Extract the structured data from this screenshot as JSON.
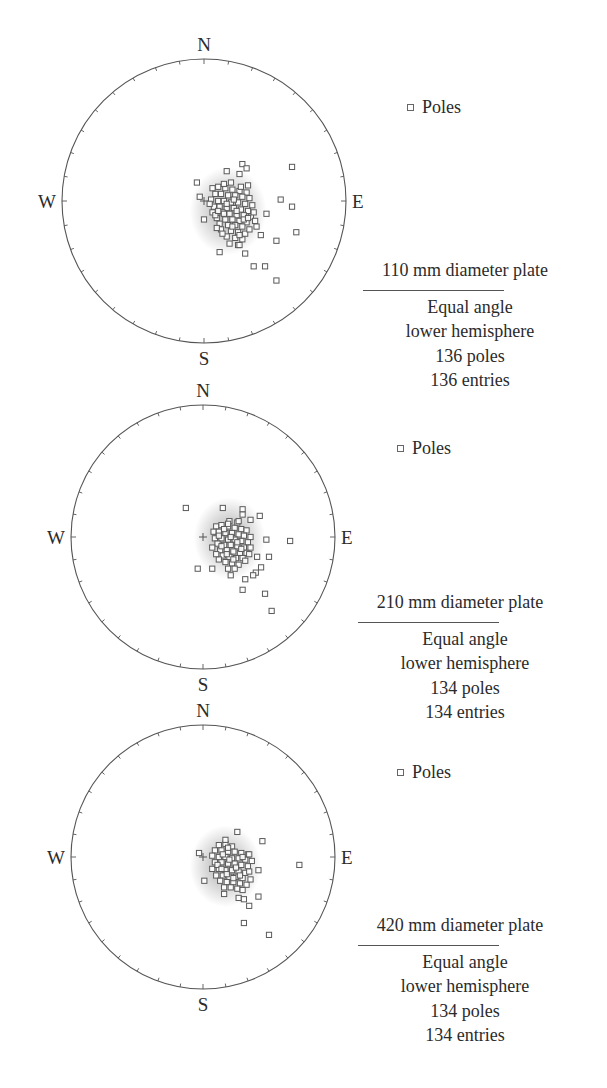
{
  "figure": {
    "legend_label": "Poles",
    "legend_marker": "square-marker-icon",
    "compass": {
      "north": "N",
      "south": "S",
      "east": "E",
      "west": "W"
    },
    "colors": {
      "circle": "#555555",
      "marker_stroke": "#5a5a5a",
      "density_halo": "#9a9a9a",
      "text": "#2b2b2b"
    }
  },
  "panels": [
    {
      "title": "110 mm diameter plate",
      "projection": "Equal angle",
      "hemisphere": "lower hemisphere",
      "poles_text": "136 poles",
      "entries_text": "136 entries"
    },
    {
      "title": "210 mm diameter plate",
      "projection": "Equal angle",
      "hemisphere": "lower hemisphere",
      "poles_text": "134 poles",
      "entries_text": "134 entries"
    },
    {
      "title": "420 mm diameter plate",
      "projection": "Equal angle",
      "hemisphere": "lower hemisphere",
      "poles_text": "134 poles",
      "entries_text": "134 entries"
    }
  ],
  "chart_data": [
    {
      "type": "scatter",
      "subtype": "stereonet",
      "title": "110 mm diameter plate",
      "projection": "Equal angle, lower hemisphere",
      "n_poles": 136,
      "n_entries": 136,
      "legend": [
        "Poles"
      ],
      "note": "points are approximate offsets from net center, in units of net radius (x east +, y south +)",
      "density_center": [
        0.17,
        0.07
      ],
      "points_outer": [
        [
          0.27,
          -0.26
        ],
        [
          0.3,
          -0.23
        ],
        [
          0.16,
          -0.21
        ],
        [
          0.25,
          -0.19
        ],
        [
          0.62,
          -0.24
        ],
        [
          -0.05,
          -0.13
        ],
        [
          -0.03,
          -0.03
        ],
        [
          0.0,
          0.13
        ],
        [
          0.54,
          -0.01
        ],
        [
          0.62,
          0.04
        ],
        [
          0.65,
          0.22
        ],
        [
          0.44,
          0.09
        ],
        [
          0.51,
          0.28
        ],
        [
          0.11,
          0.36
        ],
        [
          0.29,
          0.37
        ],
        [
          0.35,
          0.46
        ],
        [
          0.43,
          0.46
        ],
        [
          0.51,
          0.56
        ],
        [
          0.31,
          0.12
        ],
        [
          0.37,
          0.18
        ],
        [
          0.4,
          0.24
        ],
        [
          0.25,
          0.31
        ]
      ],
      "points_core": [
        [
          0.06,
          -0.09
        ],
        [
          0.1,
          -0.1
        ],
        [
          0.15,
          -0.09
        ],
        [
          0.2,
          -0.08
        ],
        [
          0.25,
          -0.07
        ],
        [
          0.3,
          -0.06
        ],
        [
          0.08,
          -0.05
        ],
        [
          0.12,
          -0.05
        ],
        [
          0.17,
          -0.04
        ],
        [
          0.22,
          -0.04
        ],
        [
          0.27,
          -0.03
        ],
        [
          0.32,
          -0.02
        ],
        [
          0.05,
          -0.01
        ],
        [
          0.1,
          0.0
        ],
        [
          0.14,
          0.0
        ],
        [
          0.19,
          0.01
        ],
        [
          0.24,
          0.01
        ],
        [
          0.29,
          0.02
        ],
        [
          0.34,
          0.03
        ],
        [
          0.07,
          0.04
        ],
        [
          0.11,
          0.04
        ],
        [
          0.16,
          0.05
        ],
        [
          0.21,
          0.05
        ],
        [
          0.26,
          0.06
        ],
        [
          0.31,
          0.07
        ],
        [
          0.06,
          0.08
        ],
        [
          0.13,
          0.08
        ],
        [
          0.18,
          0.09
        ],
        [
          0.23,
          0.1
        ],
        [
          0.28,
          0.1
        ],
        [
          0.33,
          0.11
        ],
        [
          0.09,
          0.12
        ],
        [
          0.15,
          0.13
        ],
        [
          0.2,
          0.13
        ],
        [
          0.25,
          0.14
        ],
        [
          0.3,
          0.15
        ],
        [
          0.11,
          0.16
        ],
        [
          0.17,
          0.17
        ],
        [
          0.22,
          0.17
        ],
        [
          0.27,
          0.18
        ],
        [
          0.12,
          0.2
        ],
        [
          0.19,
          0.21
        ],
        [
          0.24,
          0.22
        ],
        [
          0.29,
          0.23
        ],
        [
          0.16,
          0.25
        ],
        [
          0.22,
          0.26
        ],
        [
          0.27,
          0.27
        ],
        [
          0.18,
          0.3
        ],
        [
          0.24,
          0.31
        ],
        [
          0.13,
          0.23
        ],
        [
          0.09,
          0.19
        ],
        [
          0.35,
          0.08
        ],
        [
          0.36,
          0.14
        ],
        [
          0.04,
          0.02
        ],
        [
          0.21,
          -0.01
        ],
        [
          0.26,
          -0.1
        ],
        [
          0.14,
          -0.12
        ],
        [
          0.19,
          -0.13
        ],
        [
          0.31,
          -0.11
        ],
        [
          0.08,
          0.1
        ],
        [
          0.16,
          0.02
        ],
        [
          0.23,
          0.07
        ],
        [
          0.28,
          0.13
        ],
        [
          0.2,
          0.18
        ],
        [
          0.14,
          0.09
        ],
        [
          0.25,
          0.24
        ],
        [
          0.1,
          0.07
        ],
        [
          0.32,
          0.2
        ]
      ]
    },
    {
      "type": "scatter",
      "subtype": "stereonet",
      "title": "210 mm diameter plate",
      "projection": "Equal angle, lower hemisphere",
      "n_poles": 134,
      "n_entries": 134,
      "legend": [
        "Poles"
      ],
      "note": "points are approximate offsets from net center, in units of net radius (x east +, y south +)",
      "density_center": [
        0.2,
        0.01
      ],
      "points_outer": [
        [
          -0.13,
          -0.22
        ],
        [
          0.15,
          -0.22
        ],
        [
          0.3,
          -0.21
        ],
        [
          0.3,
          -0.17
        ],
        [
          0.43,
          -0.16
        ],
        [
          0.36,
          -0.13
        ],
        [
          0.66,
          0.03
        ],
        [
          0.48,
          0.02
        ],
        [
          0.5,
          0.15
        ],
        [
          0.41,
          0.15
        ],
        [
          -0.04,
          0.24
        ],
        [
          0.07,
          0.24
        ],
        [
          0.44,
          0.23
        ],
        [
          0.4,
          0.27
        ],
        [
          0.21,
          0.29
        ],
        [
          0.32,
          0.32
        ],
        [
          0.3,
          0.4
        ],
        [
          0.47,
          0.43
        ],
        [
          0.52,
          0.56
        ],
        [
          0.38,
          0.29
        ],
        [
          0.27,
          -0.12
        ],
        [
          0.19,
          -0.1
        ]
      ],
      "points_core": [
        [
          0.1,
          -0.08
        ],
        [
          0.14,
          -0.09
        ],
        [
          0.19,
          -0.08
        ],
        [
          0.24,
          -0.07
        ],
        [
          0.29,
          -0.06
        ],
        [
          0.33,
          -0.05
        ],
        [
          0.08,
          -0.04
        ],
        [
          0.12,
          -0.04
        ],
        [
          0.17,
          -0.03
        ],
        [
          0.22,
          -0.03
        ],
        [
          0.27,
          -0.02
        ],
        [
          0.31,
          -0.01
        ],
        [
          0.36,
          0.0
        ],
        [
          0.09,
          0.01
        ],
        [
          0.14,
          0.01
        ],
        [
          0.19,
          0.02
        ],
        [
          0.24,
          0.02
        ],
        [
          0.29,
          0.03
        ],
        [
          0.34,
          0.04
        ],
        [
          0.11,
          0.05
        ],
        [
          0.16,
          0.06
        ],
        [
          0.21,
          0.06
        ],
        [
          0.26,
          0.07
        ],
        [
          0.31,
          0.08
        ],
        [
          0.13,
          0.1
        ],
        [
          0.18,
          0.1
        ],
        [
          0.23,
          0.11
        ],
        [
          0.28,
          0.12
        ],
        [
          0.33,
          0.12
        ],
        [
          0.15,
          0.14
        ],
        [
          0.2,
          0.15
        ],
        [
          0.25,
          0.16
        ],
        [
          0.3,
          0.16
        ],
        [
          0.17,
          0.19
        ],
        [
          0.22,
          0.2
        ],
        [
          0.27,
          0.21
        ],
        [
          0.12,
          0.17
        ],
        [
          0.36,
          0.08
        ],
        [
          0.07,
          0.08
        ],
        [
          0.2,
          -0.12
        ],
        [
          0.26,
          -0.11
        ],
        [
          0.16,
          -0.06
        ],
        [
          0.21,
          0.0
        ],
        [
          0.26,
          0.04
        ],
        [
          0.18,
          0.13
        ],
        [
          0.23,
          0.17
        ],
        [
          0.29,
          0.09
        ],
        [
          0.14,
          0.07
        ],
        [
          0.32,
          0.18
        ],
        [
          0.24,
          0.24
        ],
        [
          0.19,
          0.24
        ],
        [
          0.1,
          0.13
        ],
        [
          0.35,
          0.13
        ],
        [
          0.12,
          -0.01
        ]
      ]
    },
    {
      "type": "scatter",
      "subtype": "stereonet",
      "title": "420 mm diameter plate",
      "projection": "Equal angle, lower hemisphere",
      "n_poles": 134,
      "n_entries": 134,
      "legend": [
        "Poles"
      ],
      "note": "points are approximate offsets from net center, in units of net radius (x east +, y south +)",
      "density_center": [
        0.17,
        0.07
      ],
      "points_outer": [
        [
          0.26,
          -0.19
        ],
        [
          0.45,
          -0.12
        ],
        [
          0.17,
          -0.13
        ],
        [
          -0.03,
          -0.03
        ],
        [
          0.73,
          0.06
        ],
        [
          0.35,
          -0.02
        ],
        [
          0.01,
          0.18
        ],
        [
          0.16,
          0.28
        ],
        [
          0.3,
          0.25
        ],
        [
          0.42,
          0.3
        ],
        [
          0.27,
          0.31
        ],
        [
          0.31,
          0.32
        ],
        [
          0.35,
          0.37
        ],
        [
          0.31,
          0.5
        ],
        [
          0.5,
          0.59
        ],
        [
          0.14,
          0.09
        ],
        [
          0.42,
          0.1
        ]
      ],
      "points_core": [
        [
          0.12,
          -0.09
        ],
        [
          0.17,
          -0.1
        ],
        [
          0.22,
          -0.08
        ],
        [
          0.09,
          -0.05
        ],
        [
          0.14,
          -0.05
        ],
        [
          0.19,
          -0.04
        ],
        [
          0.24,
          -0.04
        ],
        [
          0.29,
          -0.03
        ],
        [
          0.34,
          -0.02
        ],
        [
          0.07,
          -0.01
        ],
        [
          0.12,
          0.0
        ],
        [
          0.17,
          0.0
        ],
        [
          0.22,
          0.01
        ],
        [
          0.27,
          0.01
        ],
        [
          0.32,
          0.02
        ],
        [
          0.37,
          0.03
        ],
        [
          0.09,
          0.04
        ],
        [
          0.14,
          0.04
        ],
        [
          0.19,
          0.05
        ],
        [
          0.24,
          0.05
        ],
        [
          0.29,
          0.06
        ],
        [
          0.34,
          0.07
        ],
        [
          0.07,
          0.09
        ],
        [
          0.12,
          0.09
        ],
        [
          0.17,
          0.1
        ],
        [
          0.22,
          0.1
        ],
        [
          0.27,
          0.11
        ],
        [
          0.32,
          0.12
        ],
        [
          0.1,
          0.14
        ],
        [
          0.15,
          0.14
        ],
        [
          0.2,
          0.15
        ],
        [
          0.25,
          0.15
        ],
        [
          0.3,
          0.16
        ],
        [
          0.35,
          0.11
        ],
        [
          0.13,
          0.18
        ],
        [
          0.18,
          0.19
        ],
        [
          0.23,
          0.19
        ],
        [
          0.28,
          0.2
        ],
        [
          0.33,
          0.21
        ],
        [
          0.16,
          0.23
        ],
        [
          0.21,
          0.23
        ],
        [
          0.26,
          0.24
        ],
        [
          0.15,
          -0.02
        ],
        [
          0.2,
          0.02
        ],
        [
          0.25,
          0.08
        ],
        [
          0.18,
          0.13
        ],
        [
          0.23,
          0.16
        ],
        [
          0.28,
          0.14
        ],
        [
          0.11,
          0.06
        ],
        [
          0.3,
          0.0
        ],
        [
          0.19,
          -0.07
        ],
        [
          0.36,
          0.17
        ]
      ]
    }
  ]
}
